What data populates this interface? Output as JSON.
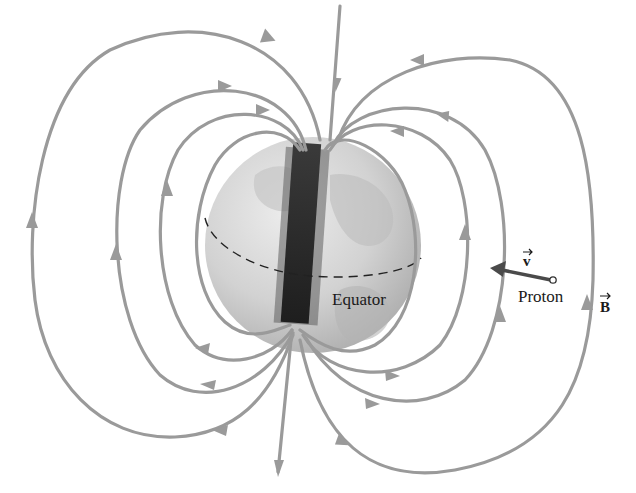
{
  "diagram": {
    "labels": {
      "equator": "Equator",
      "proton": "Proton",
      "velocity": "v",
      "field": "B"
    },
    "colors": {
      "field_lines": "#9a9a9a",
      "globe_light": "#e0e0e0",
      "globe_dark": "#a8a8a8",
      "bar_magnet": "#2a2a2a",
      "velocity_arrow": "#4a4a4a",
      "text": "#1a1a1a"
    },
    "elements": {
      "globe": "Earth globe (grayscale)",
      "bar_magnet": "Tilted bar magnet through Earth's center",
      "equator_line": "Dashed equator line",
      "field_lines": "Magnetic field lines exiting south (bottom) and entering north (top), with direction arrowheads",
      "proton": "Proton (small open circle) with velocity vector pointing left",
      "field_vector_label": "B vector label at right"
    }
  }
}
